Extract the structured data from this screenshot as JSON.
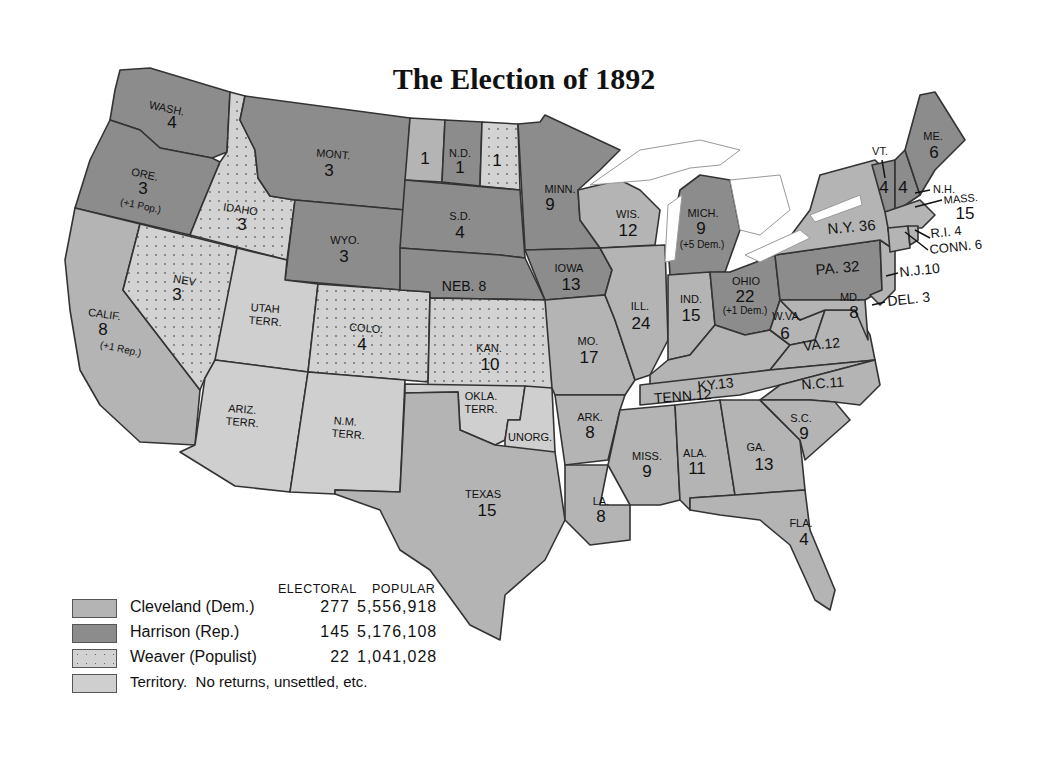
{
  "title": "The Election of 1892",
  "colors": {
    "democrat": "#b4b4b4",
    "republican": "#8c8c8c",
    "populist": "#d0d0d0",
    "territory": "#cfcfcf",
    "border": "#333333",
    "water": "#ffffff"
  },
  "legend": {
    "electoral_header": "ELECTORAL",
    "popular_header": "POPULAR",
    "rows": [
      {
        "name": "Cleveland (Dem.)",
        "electoral": "277",
        "popular": "5,556,918",
        "pattern": "democrat"
      },
      {
        "name": "Harrison (Rep.)",
        "electoral": "145",
        "popular": "5,176,108",
        "pattern": "republican"
      },
      {
        "name": "Weaver (Populist)",
        "electoral": "22",
        "popular": "1,041,028",
        "pattern": "populist"
      },
      {
        "name": "Territory.  No returns, unsettled, etc.",
        "electoral": "",
        "popular": "",
        "pattern": "territory"
      }
    ]
  },
  "states": {
    "wash": {
      "name": "WASH.",
      "votes": "4"
    },
    "ore": {
      "name": "ORE.",
      "votes": "3",
      "note": "(+1 Pop.)"
    },
    "calif": {
      "name": "CALIF.",
      "votes": "8",
      "note": "(+1 Rep.)"
    },
    "idaho": {
      "name": "IDAHO",
      "votes": "3"
    },
    "nev": {
      "name": "NEV",
      "votes": "3"
    },
    "mont": {
      "name": "MONT.",
      "votes": "3"
    },
    "wyo": {
      "name": "WYO.",
      "votes": "3"
    },
    "utah": {
      "name": "UTAH",
      "sub": "TERR."
    },
    "colo": {
      "name": "COLO.",
      "votes": "4"
    },
    "ariz": {
      "name": "ARIZ.",
      "sub": "TERR."
    },
    "nm": {
      "name": "N.M.",
      "sub": "TERR."
    },
    "nd": {
      "name": "N.D.",
      "votes": "1",
      "left_votes": "1",
      "right_votes": "1"
    },
    "sd": {
      "name": "S.D.",
      "votes": "4"
    },
    "neb": {
      "name": "NEB. 8"
    },
    "kan": {
      "name": "KAN.",
      "votes": "10"
    },
    "okla": {
      "name": "OKLA.",
      "sub": "TERR."
    },
    "unorg": {
      "name": "UNORG."
    },
    "texas": {
      "name": "TEXAS",
      "votes": "15"
    },
    "minn": {
      "name": "MINN.",
      "votes": "9"
    },
    "iowa": {
      "name": "IOWA",
      "votes": "13"
    },
    "mo": {
      "name": "MO.",
      "votes": "17"
    },
    "ark": {
      "name": "ARK.",
      "votes": "8"
    },
    "la": {
      "name": "LA.",
      "votes": "8"
    },
    "wis": {
      "name": "WIS.",
      "votes": "12"
    },
    "ill": {
      "name": "ILL.",
      "votes": "24"
    },
    "mich": {
      "name": "MICH.",
      "votes": "9",
      "note": "(+5 Dem.)"
    },
    "ind": {
      "name": "IND.",
      "votes": "15"
    },
    "ohio": {
      "name": "OHIO",
      "votes": "22",
      "note": "(+1 Dem.)"
    },
    "ky": {
      "name": "KY.13"
    },
    "tenn": {
      "name": "TENN.12"
    },
    "miss": {
      "name": "MISS.",
      "votes": "9"
    },
    "ala": {
      "name": "ALA.",
      "votes": "11"
    },
    "ga": {
      "name": "GA.",
      "votes": "13"
    },
    "fla": {
      "name": "FLA.",
      "votes": "4"
    },
    "sc": {
      "name": "S.C.",
      "votes": "9"
    },
    "nc": {
      "name": "N.C.11"
    },
    "va": {
      "name": "VA.12"
    },
    "wva": {
      "name": "W.VA.",
      "votes": "6"
    },
    "md": {
      "name": "MD.",
      "votes": "8"
    },
    "del": {
      "name": "DEL. 3"
    },
    "nj": {
      "name": "N.J.10"
    },
    "pa": {
      "name": "PA. 32"
    },
    "ny": {
      "name": "N.Y. 36"
    },
    "vt": {
      "name": "VT.",
      "votes": "4"
    },
    "nh": {
      "name": "N.H.",
      "votes": "4"
    },
    "me": {
      "name": "ME.",
      "votes": "6"
    },
    "mass": {
      "name": "MASS.",
      "votes": "15"
    },
    "ri": {
      "name": "R.I. 4"
    },
    "conn": {
      "name": "CONN. 6"
    }
  }
}
